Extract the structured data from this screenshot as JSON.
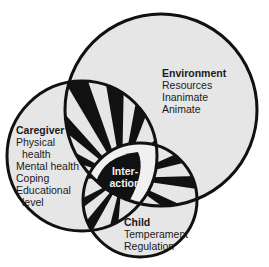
{
  "diagram": {
    "type": "venn",
    "colors": {
      "fill": "#e6e6e6",
      "stroke": "#111111",
      "stripe": "#111111",
      "center_text": "#f2f2f2"
    },
    "circles": {
      "environment": {
        "title": "Environment",
        "items": [
          "Resources",
          "Inanimate",
          "Animate"
        ]
      },
      "caregiver": {
        "title": "Caregiver",
        "items": [
          "Physical",
          "health",
          "Mental health",
          "Coping",
          "Educational",
          "level"
        ]
      },
      "child": {
        "title": "Child",
        "items": [
          "Temperament",
          "Regulation"
        ]
      }
    },
    "center": {
      "line1": "Inter-",
      "line2": "action"
    }
  }
}
